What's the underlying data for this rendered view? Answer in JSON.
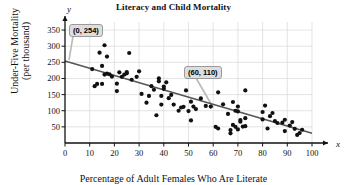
{
  "chart_data": {
    "type": "scatter",
    "title": "Literacy and Child Mortality",
    "xlabel": "Percentage of Adult Females Who Are Literate",
    "ylabel": "Under-Five Mortality\n(per thousand)",
    "ylabel_line1": "Under-Five Mortality",
    "ylabel_line2": "(per thousand)",
    "axis_name_x": "x",
    "axis_name_y": "y",
    "xlim": [
      0,
      100
    ],
    "ylim": [
      0,
      375
    ],
    "xticks": [
      0,
      10,
      20,
      30,
      40,
      50,
      60,
      70,
      80,
      90,
      100
    ],
    "yticks": [
      50,
      100,
      150,
      200,
      250,
      300,
      350
    ],
    "grid": true,
    "legend": "none",
    "colors": {
      "point": "#111111",
      "trendline": "#555555",
      "grid": "#d8d8d8",
      "axis": "#111111",
      "annotation_bg": "#dedede",
      "annotation_border": "#9a9a9a"
    },
    "trendline": {
      "name": "least-squares regression line",
      "x": [
        0,
        100
      ],
      "y": [
        254,
        30
      ],
      "intercept": 254,
      "slope": -2.24
    },
    "annotations": [
      {
        "label": "(0, 254)",
        "x": 0,
        "y": 254
      },
      {
        "label": "(60, 110)",
        "x": 60,
        "y": 110
      }
    ],
    "points": [
      [
        11,
        229
      ],
      [
        12,
        176
      ],
      [
        13,
        183
      ],
      [
        14,
        280
      ],
      [
        15,
        183
      ],
      [
        15,
        239
      ],
      [
        16,
        303
      ],
      [
        16,
        212
      ],
      [
        17,
        215
      ],
      [
        17,
        268
      ],
      [
        18,
        213
      ],
      [
        19,
        206
      ],
      [
        21,
        161
      ],
      [
        21,
        184
      ],
      [
        22,
        219
      ],
      [
        23,
        205
      ],
      [
        24,
        212
      ],
      [
        25,
        216
      ],
      [
        25,
        220
      ],
      [
        26,
        279
      ],
      [
        27,
        196
      ],
      [
        29,
        205
      ],
      [
        30,
        222
      ],
      [
        31,
        152
      ],
      [
        33,
        125
      ],
      [
        34,
        146
      ],
      [
        35,
        176
      ],
      [
        36,
        165
      ],
      [
        37,
        86
      ],
      [
        38,
        200
      ],
      [
        38,
        191
      ],
      [
        39,
        119
      ],
      [
        39,
        146
      ],
      [
        40,
        168
      ],
      [
        40,
        175
      ],
      [
        41,
        188
      ],
      [
        42,
        139
      ],
      [
        43,
        149
      ],
      [
        44,
        119
      ],
      [
        46,
        100
      ],
      [
        47,
        110
      ],
      [
        48,
        112
      ],
      [
        49,
        163
      ],
      [
        50,
        99
      ],
      [
        51,
        70
      ],
      [
        51,
        128
      ],
      [
        52,
        113
      ],
      [
        53,
        105
      ],
      [
        55,
        138
      ],
      [
        57,
        115
      ],
      [
        59,
        113
      ],
      [
        61,
        50
      ],
      [
        62,
        157
      ],
      [
        62,
        45
      ],
      [
        64,
        120
      ],
      [
        66,
        90
      ],
      [
        67,
        30
      ],
      [
        67,
        40
      ],
      [
        68,
        127
      ],
      [
        68,
        56
      ],
      [
        69,
        50
      ],
      [
        69,
        100
      ],
      [
        70,
        113
      ],
      [
        70,
        98
      ],
      [
        70,
        42
      ],
      [
        71,
        66
      ],
      [
        71,
        71
      ],
      [
        72,
        51
      ],
      [
        73,
        163
      ],
      [
        73,
        52
      ],
      [
        73,
        77
      ],
      [
        80,
        73
      ],
      [
        80,
        96
      ],
      [
        81,
        116
      ],
      [
        82,
        45
      ],
      [
        83,
        83
      ],
      [
        84,
        93
      ],
      [
        85,
        68
      ],
      [
        86,
        62
      ],
      [
        88,
        63
      ],
      [
        89,
        37
      ],
      [
        89,
        72
      ],
      [
        91,
        54
      ],
      [
        92,
        65
      ],
      [
        93,
        44
      ],
      [
        94,
        25
      ],
      [
        95,
        31
      ],
      [
        96,
        41
      ]
    ]
  }
}
